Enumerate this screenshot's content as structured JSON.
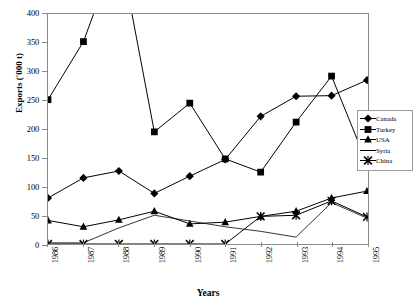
{
  "chart_data": {
    "type": "line",
    "title": "",
    "xlabel": "Years",
    "ylabel": "Exports ('000 t)",
    "categories": [
      "1986",
      "1987",
      "1988",
      "1989",
      "1990",
      "1991",
      "1992",
      "1993",
      "1994",
      "1995"
    ],
    "x": [
      1986,
      1987,
      1988,
      1989,
      1990,
      1991,
      1992,
      1993,
      1994,
      1995
    ],
    "xlim": [
      1986,
      1995
    ],
    "ylim": [
      0,
      400
    ],
    "yticks": [
      0,
      50,
      100,
      150,
      200,
      250,
      300,
      350,
      400
    ],
    "grid": false,
    "legend_position": "right",
    "series": [
      {
        "name": "Canada",
        "marker": "diamond",
        "color": "#000000",
        "values": [
          80,
          115,
          127,
          88,
          118,
          147,
          222,
          257,
          258,
          285
        ]
      },
      {
        "name": "Turkey",
        "marker": "square",
        "color": "#000000",
        "values": [
          251,
          352,
          520,
          195,
          245,
          148,
          125,
          212,
          292,
          140
        ],
        "note": "1988 value rises above the 400 axis maximum and is clipped by the plot frame"
      },
      {
        "name": "USA",
        "marker": "triangle",
        "color": "#000000",
        "values": [
          41,
          30,
          42,
          57,
          35,
          38,
          48,
          57,
          80,
          92
        ]
      },
      {
        "name": "Syria",
        "marker": "none",
        "color": "#000000",
        "values": [
          2,
          2,
          28,
          50,
          40,
          30,
          22,
          12,
          72,
          45
        ]
      },
      {
        "name": "China",
        "marker": "x",
        "color": "#000000",
        "values": [
          0,
          0,
          0,
          0,
          0,
          0,
          48,
          50,
          75,
          47
        ]
      }
    ]
  },
  "axis": {
    "y_title": "Exports ('000 t)",
    "x_title": "Years",
    "y_tick_labels": [
      "400",
      "350",
      "300",
      "250",
      "200",
      "150",
      "100",
      "50",
      "0"
    ],
    "x_tick_labels": [
      "1986",
      "1987",
      "1988",
      "1989",
      "1990",
      "1991",
      "1992",
      "1993",
      "1994",
      "1995"
    ]
  },
  "legend": {
    "items": [
      {
        "label": "Canada",
        "marker": "diamond"
      },
      {
        "label": "Turkey",
        "marker": "square"
      },
      {
        "label": "USA",
        "marker": "triangle"
      },
      {
        "label": "Syria",
        "marker": "none"
      },
      {
        "label": "China",
        "marker": "x"
      }
    ]
  },
  "style": {
    "line_color": "#000000",
    "frame_color": "#8a8a8a",
    "background": "#ffffff"
  }
}
